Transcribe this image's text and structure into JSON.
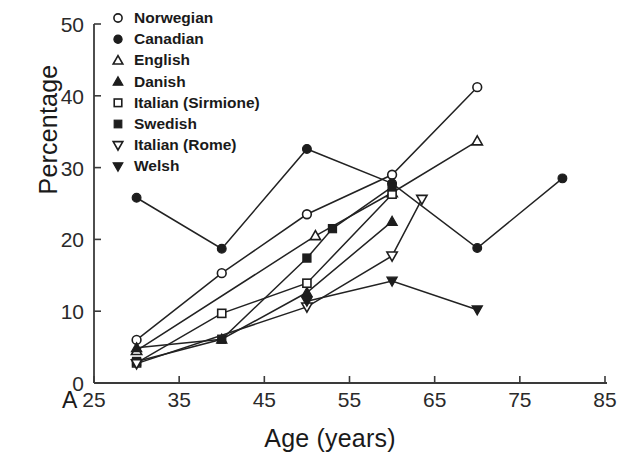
{
  "chart_data": {
    "type": "line",
    "title": "",
    "panel_label": "A",
    "xlabel": "Age (years)",
    "ylabel": "Percentage",
    "xlim": [
      25,
      85
    ],
    "ylim": [
      0,
      50
    ],
    "xticks": [
      25,
      35,
      45,
      55,
      65,
      75,
      85
    ],
    "yticks": [
      0,
      10,
      20,
      30,
      40,
      50
    ],
    "grid": false,
    "legend_position": "top-left",
    "series": [
      {
        "name": "Norwegian",
        "marker": "open-circle",
        "x": [
          30,
          40,
          50,
          60,
          70
        ],
        "y": [
          6.0,
          15.3,
          23.5,
          29.0,
          41.2
        ]
      },
      {
        "name": "Canadian",
        "marker": "filled-circle",
        "x": [
          30,
          40,
          50,
          60,
          70,
          80
        ],
        "y": [
          25.8,
          18.7,
          32.6,
          27.8,
          18.8,
          28.5
        ]
      },
      {
        "name": "English",
        "marker": "open-triangle-up",
        "x": [
          30,
          51,
          60,
          70
        ],
        "y": [
          4.5,
          20.5,
          26.5,
          33.7
        ]
      },
      {
        "name": "Danish",
        "marker": "filled-triangle-up",
        "x": [
          30,
          40,
          50,
          60
        ],
        "y": [
          4.9,
          6.1,
          12.6,
          22.5
        ]
      },
      {
        "name": "Italian (Sirmione)",
        "marker": "open-square",
        "x": [
          30,
          40,
          50,
          60
        ],
        "y": [
          2.8,
          9.7,
          13.9,
          26.3
        ]
      },
      {
        "name": "Swedish",
        "marker": "filled-square",
        "x": [
          30,
          40,
          50,
          53,
          60
        ],
        "y": [
          3.0,
          6.1,
          17.4,
          21.5,
          27.3
        ]
      },
      {
        "name": "Italian (Rome)",
        "marker": "open-triangle-down",
        "x": [
          30,
          50,
          60,
          63.5
        ],
        "y": [
          2.7,
          10.6,
          17.7,
          25.6
        ]
      },
      {
        "name": "Welsh",
        "marker": "filled-triangle-down",
        "x": [
          50,
          60,
          70
        ],
        "y": [
          11.4,
          14.2,
          10.2
        ]
      }
    ]
  },
  "legend": {
    "entries": [
      {
        "label": "Norwegian"
      },
      {
        "label": "Canadian"
      },
      {
        "label": "English"
      },
      {
        "label": "Danish"
      },
      {
        "label": "Italian (Sirmione)"
      },
      {
        "label": "Swedish"
      },
      {
        "label": "Italian (Rome)"
      },
      {
        "label": "Welsh"
      }
    ]
  },
  "colors": {
    "ink": "#1d1d1d",
    "axis": "#3a3a3a",
    "background": "#ffffff"
  }
}
